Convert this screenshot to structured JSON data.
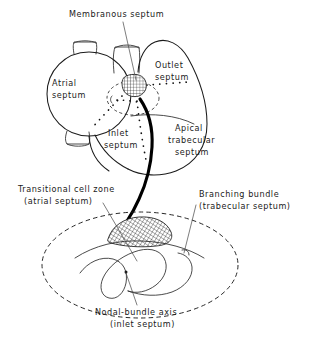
{
  "figure": {
    "background_color": "#ffffff",
    "ink_color": "#1b1b1b",
    "style": "hand-lettered anatomical line drawing"
  },
  "labels": {
    "membranous_septum": {
      "line1": "Membranous septum",
      "x": 69,
      "y": 17
    },
    "atrial_septum": {
      "line1": "Atrial",
      "line2": "septum",
      "x": 52,
      "y": 86
    },
    "outlet_septum": {
      "line1": "Outlet",
      "line2": "septum",
      "x": 155,
      "y": 68
    },
    "inlet_septum": {
      "line1": "Inlet",
      "line2": "septum",
      "x": 104,
      "y": 136
    },
    "apical_trabecular_septum": {
      "line1": "Apical",
      "line2": "trabecular",
      "line3": "septum",
      "x": 172,
      "y": 131
    },
    "transitional_cell_zone": {
      "line1": "Transitional cell zone",
      "line2": "(atrial septum)",
      "x": 18,
      "y": 192
    },
    "branching_bundle": {
      "line1": "Branching bundle",
      "line2": "(trabecular septum)",
      "x": 199,
      "y": 197
    },
    "nodal_bundle_axis": {
      "line1": "Nodal-bundle  axis",
      "line2": "(inlet septum)",
      "x": 95,
      "y": 315
    }
  },
  "regions": [
    {
      "name": "membranous-septum-patch",
      "description": "small cross-hatched oval at central fibrous body",
      "fill_pattern": "cross-hatch"
    },
    {
      "name": "transitional-cell-zone-patch",
      "description": "cross-hatched lens shape in lower inset",
      "fill_pattern": "cross-hatch"
    },
    {
      "name": "atrioventricular-node-ellipse",
      "description": "dashed ellipse enclosing central fibrous body region"
    },
    {
      "name": "inset-boundary-ellipse",
      "description": "large dashed ellipse enclosing lower magnified inset"
    },
    {
      "name": "conduction-bundle-path",
      "description": "thick black curve from membranous septum down into inset"
    }
  ]
}
